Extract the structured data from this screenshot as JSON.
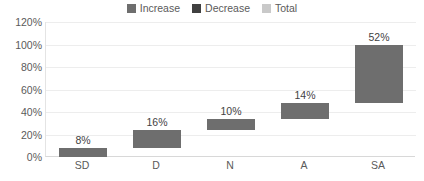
{
  "chart_data": {
    "type": "bar",
    "subtype": "waterfall",
    "title": "",
    "xlabel": "",
    "ylabel": "",
    "categories": [
      "SD",
      "D",
      "N",
      "A",
      "SA"
    ],
    "values": [
      8,
      16,
      10,
      14,
      52
    ],
    "bases": [
      0,
      8,
      24,
      34,
      48
    ],
    "data_labels": [
      "8%",
      "16%",
      "10%",
      "14%",
      "52%"
    ],
    "ylim": [
      0,
      120
    ],
    "yticks": [
      0,
      20,
      40,
      60,
      80,
      100,
      120
    ],
    "ytick_labels": [
      "0%",
      "20%",
      "40%",
      "60%",
      "80%",
      "100%",
      "120%"
    ],
    "grid": true,
    "legend_position": "top",
    "series": [
      {
        "name": "Increase",
        "color": "#6e6e6e"
      },
      {
        "name": "Decrease",
        "color": "#404040"
      },
      {
        "name": "Total",
        "color": "#c9c9c9"
      }
    ],
    "bar_color": "#6e6e6e"
  },
  "legend": {
    "items": [
      {
        "label": "Increase",
        "color": "#6e6e6e"
      },
      {
        "label": "Decrease",
        "color": "#404040"
      },
      {
        "label": "Total",
        "color": "#c9c9c9"
      }
    ]
  },
  "colors": {
    "bar": "#6e6e6e",
    "gridline": "#ededed",
    "axis": "#d8d8d8",
    "tick_text": "#5a5a5a",
    "label_text": "#3f3f3f",
    "background": "#ffffff"
  }
}
